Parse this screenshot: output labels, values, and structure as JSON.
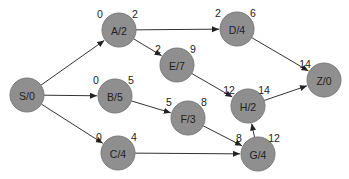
{
  "diagram": {
    "type": "network-diagram",
    "nodes": [
      {
        "id": "S",
        "label": "S/0",
        "x": 27,
        "y": 95,
        "es": "",
        "ef": ""
      },
      {
        "id": "A",
        "label": "A/2",
        "x": 119,
        "y": 30,
        "es": "0",
        "ef": "2"
      },
      {
        "id": "B",
        "label": "B/5",
        "x": 115,
        "y": 96,
        "es": "0",
        "ef": "5"
      },
      {
        "id": "C",
        "label": "C/4",
        "x": 118,
        "y": 153,
        "es": "0",
        "ef": "4"
      },
      {
        "id": "D",
        "label": "D/4",
        "x": 237,
        "y": 29,
        "es": "2",
        "ef": "6"
      },
      {
        "id": "E",
        "label": "E/7",
        "x": 177,
        "y": 65,
        "es": "2",
        "ef": "9"
      },
      {
        "id": "F",
        "label": "F/3",
        "x": 188,
        "y": 118,
        "es": "5",
        "ef": "8"
      },
      {
        "id": "H",
        "label": "H/2",
        "x": 248,
        "y": 106,
        "es": "12",
        "ef": "14"
      },
      {
        "id": "G",
        "label": "G/4",
        "x": 258,
        "y": 154,
        "es": "8",
        "ef": "12"
      },
      {
        "id": "Z",
        "label": "Z/0",
        "x": 324,
        "y": 80,
        "es": "14",
        "ef": ""
      }
    ],
    "edges": [
      [
        "S",
        "A"
      ],
      [
        "S",
        "B"
      ],
      [
        "S",
        "C"
      ],
      [
        "A",
        "D"
      ],
      [
        "A",
        "E"
      ],
      [
        "B",
        "F"
      ],
      [
        "C",
        "G"
      ],
      [
        "D",
        "Z"
      ],
      [
        "E",
        "H"
      ],
      [
        "F",
        "G"
      ],
      [
        "G",
        "H"
      ],
      [
        "H",
        "Z"
      ]
    ]
  }
}
